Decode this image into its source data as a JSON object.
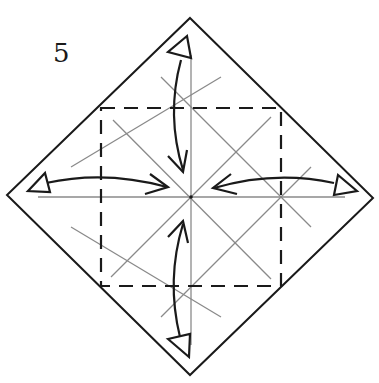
{
  "diagram": {
    "step_number": "5",
    "colors": {
      "outline": "#1a1a1a",
      "crease": "#8a8a8a",
      "dashed_fold": "#1a1a1a",
      "arrow": "#1a1a1a",
      "background": "#ffffff"
    },
    "paper": {
      "shape": "diamond",
      "vertices": [
        [
          190,
          18
        ],
        [
          373,
          198
        ],
        [
          190,
          375
        ],
        [
          7,
          195
        ]
      ]
    },
    "valley_fold_square": {
      "style": "dashed",
      "corners": [
        [
          101,
          108
        ],
        [
          281,
          108
        ],
        [
          281,
          286
        ],
        [
          101,
          286
        ]
      ]
    },
    "center": [
      191,
      197
    ],
    "arrows": [
      {
        "name": "top",
        "type": "fold-and-unfold",
        "from": "top-corner",
        "to": "center"
      },
      {
        "name": "bottom",
        "type": "fold-and-unfold",
        "from": "bottom-corner",
        "to": "center"
      },
      {
        "name": "left",
        "type": "fold-and-unfold",
        "from": "left-corner",
        "to": "center"
      },
      {
        "name": "right",
        "type": "fold-and-unfold",
        "from": "right-corner",
        "to": "center"
      }
    ]
  }
}
